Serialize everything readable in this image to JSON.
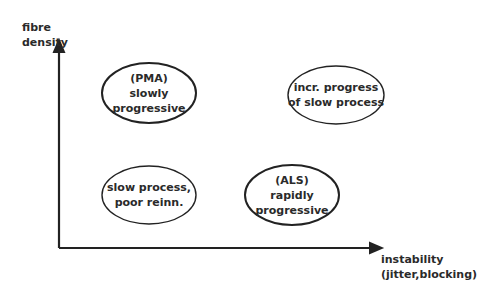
{
  "axes": {
    "y_label_line1": "fibre",
    "y_label_line2": "density",
    "x_label_line1": "instability",
    "x_label_line2": "(jitter,blocking)"
  },
  "quadrants": [
    {
      "position": "top-left",
      "line1": "(PMA)",
      "line2": "slowly",
      "line3": "progressive"
    },
    {
      "position": "top-right",
      "line1": "incr. progress",
      "line2": "of slow process",
      "line3": ""
    },
    {
      "position": "bottom-left",
      "line1": "slow process,",
      "line2": "poor reinn.",
      "line3": ""
    },
    {
      "position": "bottom-right",
      "line1": "(ALS)",
      "line2": "rapidly",
      "line3": "progressive"
    }
  ],
  "colors": {
    "stroke": "#222222",
    "background": "#ffffff"
  }
}
